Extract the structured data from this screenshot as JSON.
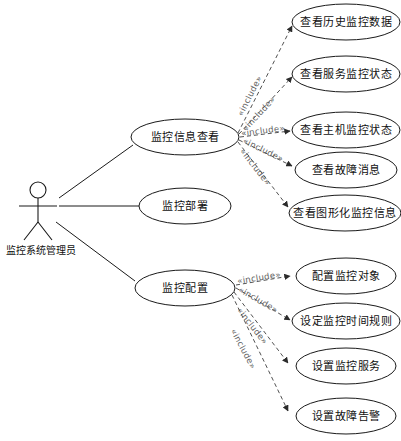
{
  "diagram": {
    "type": "uml-use-case-diagram",
    "actor": {
      "name": "监控系统管理员",
      "icon": "stick-figure-actor-icon"
    },
    "relationship_label": "«include»",
    "primary_use_cases": [
      {
        "id": "uc-view",
        "label": "监控信息查看"
      },
      {
        "id": "uc-deploy",
        "label": "监控部署"
      },
      {
        "id": "uc-config",
        "label": "监控配置"
      }
    ],
    "included_use_cases": {
      "uc-view": [
        {
          "id": "uc-view-history",
          "label": "查看历史监控数据"
        },
        {
          "id": "uc-view-service-status",
          "label": "查看服务监控状态"
        },
        {
          "id": "uc-view-host-status",
          "label": "查看主机监控状态"
        },
        {
          "id": "uc-view-fault-message",
          "label": "查看故障消息"
        },
        {
          "id": "uc-view-graphical-info",
          "label": "查看图形化监控信息"
        }
      ],
      "uc-config": [
        {
          "id": "uc-config-target",
          "label": "配置监控对象"
        },
        {
          "id": "uc-config-time-rule",
          "label": "设定监控时间规则"
        },
        {
          "id": "uc-config-service",
          "label": "设置监控服务"
        },
        {
          "id": "uc-config-fault-alarm",
          "label": "设置故障告警"
        }
      ]
    },
    "colors": {
      "stroke": "#1a1a1a",
      "include_stroke": "#3d3d3d",
      "include_text": "#5e5e5e",
      "background": "#ffffff"
    }
  }
}
